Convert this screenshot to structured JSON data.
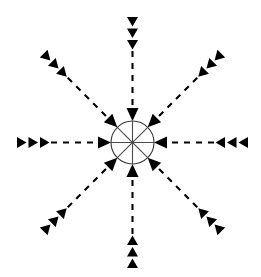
{
  "figure": {
    "background_color": "#ffffff",
    "stroke_color": "#000000",
    "hub_stroke_color": "#3c3c3c",
    "spoke_stroke_color": "#4a4a4a"
  },
  "hub": {
    "name": "central-circle",
    "center_x": 132.5,
    "center_y": 142.5,
    "radius": 21.5,
    "spoke_count": 8,
    "spoke_angles_deg": [
      0,
      45,
      90,
      135,
      180,
      225,
      270,
      315
    ]
  },
  "arrows": [
    {
      "name": "arrow-north",
      "direction_label": "N",
      "angle_deg": 270,
      "points_inward": true,
      "tail_marker_count": 3,
      "tail_x": 132.5,
      "tail_y": 17.0,
      "head_x": 132.5,
      "head_y": 121.0
    },
    {
      "name": "arrow-northeast",
      "direction_label": "NE",
      "angle_deg": 315,
      "points_inward": true,
      "tail_marker_count": 3,
      "tail_x": 221.3,
      "tail_y": 53.7,
      "head_x": 147.7,
      "head_y": 127.3
    },
    {
      "name": "arrow-east",
      "direction_label": "E",
      "angle_deg": 0,
      "points_inward": true,
      "tail_marker_count": 3,
      "tail_x": 248.0,
      "tail_y": 142.5,
      "head_x": 154.0,
      "head_y": 142.5
    },
    {
      "name": "arrow-southeast",
      "direction_label": "SE",
      "angle_deg": 45,
      "points_inward": true,
      "tail_marker_count": 3,
      "tail_x": 221.3,
      "tail_y": 231.3,
      "head_x": 147.7,
      "head_y": 157.7
    },
    {
      "name": "arrow-south",
      "direction_label": "S",
      "angle_deg": 90,
      "points_inward": true,
      "tail_marker_count": 3,
      "tail_x": 132.5,
      "tail_y": 268.0,
      "head_x": 132.5,
      "head_y": 164.0
    },
    {
      "name": "arrow-southwest",
      "direction_label": "SW",
      "angle_deg": 135,
      "points_inward": true,
      "tail_marker_count": 3,
      "tail_x": 43.7,
      "tail_y": 231.3,
      "head_x": 117.3,
      "head_y": 157.7
    },
    {
      "name": "arrow-west",
      "direction_label": "W",
      "angle_deg": 180,
      "points_inward": true,
      "tail_marker_count": 3,
      "tail_x": 17.0,
      "tail_y": 142.5,
      "head_x": 111.0,
      "head_y": 142.5
    },
    {
      "name": "arrow-northwest",
      "direction_label": "NW",
      "angle_deg": 225,
      "points_inward": true,
      "tail_marker_count": 3,
      "tail_x": 43.7,
      "tail_y": 53.7,
      "head_x": 117.3,
      "head_y": 127.3
    }
  ],
  "geometry": {
    "arrow_head_length": 13,
    "arrow_head_half_width": 6,
    "tail_marker_length": 9.5,
    "tail_marker_half_width": 5.5,
    "tail_marker_spacing": 11.5,
    "dash_pattern": "6 6"
  }
}
